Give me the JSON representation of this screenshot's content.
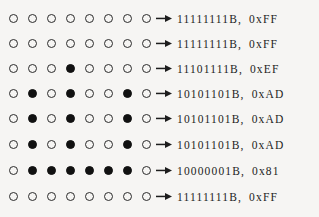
{
  "figure": {
    "name": "bit-pattern-to-byte-value-diagram",
    "background_color": "#f6f5f3",
    "ink_color": "#111111",
    "bit_count_per_row": 8,
    "row_count": 8,
    "legend": {
      "open_circle_meaning": "1",
      "filled_circle_meaning": "0"
    },
    "arrow_icon": "right-arrow-icon"
  },
  "rows": [
    {
      "index": 1,
      "bits": [
        0,
        0,
        0,
        0,
        0,
        0,
        0,
        0
      ],
      "binary": "11111111B",
      "separator": ",",
      "hex": "0xFF"
    },
    {
      "index": 2,
      "bits": [
        0,
        0,
        0,
        0,
        0,
        0,
        0,
        0
      ],
      "binary": "11111111B",
      "separator": ",",
      "hex": "0xFF"
    },
    {
      "index": 3,
      "bits": [
        0,
        0,
        0,
        1,
        0,
        0,
        0,
        0
      ],
      "binary": "11101111B",
      "separator": ",",
      "hex": "0xEF"
    },
    {
      "index": 4,
      "bits": [
        0,
        1,
        0,
        1,
        0,
        0,
        1,
        0
      ],
      "binary": "10101101B",
      "separator": ",",
      "hex": "0xAD"
    },
    {
      "index": 5,
      "bits": [
        0,
        1,
        0,
        1,
        0,
        0,
        1,
        0
      ],
      "binary": "10101101B",
      "separator": ",",
      "hex": "0xAD"
    },
    {
      "index": 6,
      "bits": [
        0,
        1,
        0,
        1,
        0,
        0,
        1,
        0
      ],
      "binary": "10101101B",
      "separator": ",",
      "hex": "0xAD"
    },
    {
      "index": 7,
      "bits": [
        0,
        1,
        1,
        1,
        1,
        1,
        1,
        0
      ],
      "binary": "10000001B",
      "separator": ",",
      "hex": "0x81"
    },
    {
      "index": 8,
      "bits": [
        0,
        0,
        0,
        0,
        0,
        0,
        0,
        0
      ],
      "binary": "11111111B",
      "separator": ",",
      "hex": "0xFF"
    }
  ]
}
